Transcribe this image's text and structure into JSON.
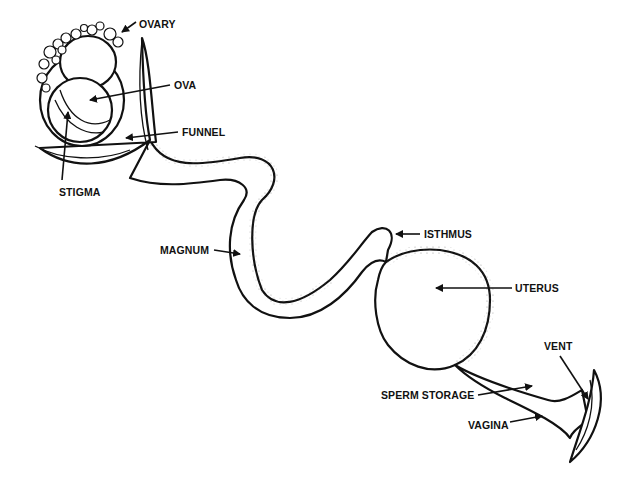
{
  "diagram": {
    "labels": {
      "ovary": "OVARY",
      "ova": "OVA",
      "funnel": "FUNNEL",
      "stigma": "STIGMA",
      "magnum": "MAGNUM",
      "isthmus": "ISTHMUS",
      "uterus": "UTERUS",
      "vent": "VENT",
      "sperm_storage": "SPERM STORAGE",
      "vagina": "VAGINA"
    },
    "colors": {
      "ink": "#111111",
      "background": "#ffffff"
    }
  }
}
